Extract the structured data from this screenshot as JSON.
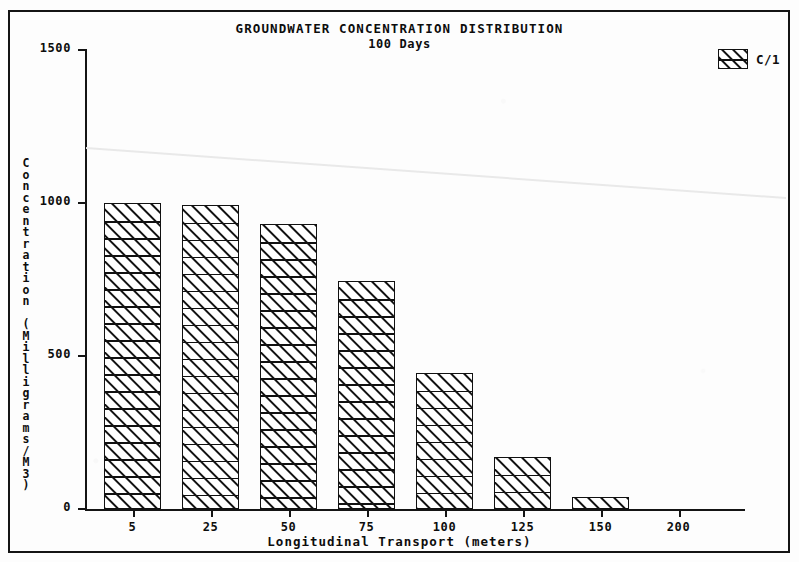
{
  "figure": {
    "title": "GROUNDWATER CONCENTRATION DISTRIBUTION",
    "subtitle": "100 Days",
    "background_color": "#fdfdfd",
    "ink_color": "#111111",
    "frame": "rectangular double-line border"
  },
  "legend": {
    "position": "top-right",
    "entries": [
      {
        "label": "C/1",
        "pattern": "diagonal-hatch",
        "color": "#111111"
      }
    ]
  },
  "chart_data": {
    "type": "bar",
    "title": "GROUNDWATER CONCENTRATION DISTRIBUTION",
    "subtitle": "100 Days",
    "xlabel": "Longitudinal Transport (meters)",
    "ylabel": "Concentration (Milligrams/M3)",
    "categories": [
      "5",
      "25",
      "50",
      "75",
      "100",
      "125",
      "150",
      "200"
    ],
    "series": [
      {
        "name": "C/1",
        "values": [
          1000,
          995,
          930,
          745,
          445,
          170,
          40,
          0
        ]
      }
    ],
    "ylim": [
      0,
      1500
    ],
    "yticks": [
      0,
      500,
      1000,
      1500
    ],
    "ytick_labels": [
      "0",
      "500",
      "1000",
      "1500"
    ],
    "xtick_labels": [
      "5",
      "25",
      "50",
      "75",
      "100",
      "125",
      "150",
      "200"
    ],
    "grid": false,
    "legend_position": "upper right",
    "bar_fill": "white",
    "bar_hatch": "diagonal lines",
    "bar_edge_color": "#111111"
  },
  "axes": {
    "y": {
      "title_lines": [
        "C",
        "o",
        "n",
        "c",
        "e",
        "n",
        "t",
        "r",
        "a",
        "t",
        "i",
        "o",
        "n",
        " ",
        "(",
        "M",
        "i",
        "l",
        "l",
        "i",
        "g",
        "r",
        "a",
        "m",
        "s",
        "/",
        "M",
        "3",
        ")"
      ],
      "ticks": [
        {
          "label": "1500",
          "value": 1500
        },
        {
          "label": "1000",
          "value": 1000
        },
        {
          "label": "500",
          "value": 500
        },
        {
          "label": "0",
          "value": 0
        }
      ]
    },
    "x": {
      "title": "Longitudinal Transport (meters)",
      "ticks": [
        "5",
        "25",
        "50",
        "75",
        "100",
        "125",
        "150",
        "200"
      ]
    }
  }
}
